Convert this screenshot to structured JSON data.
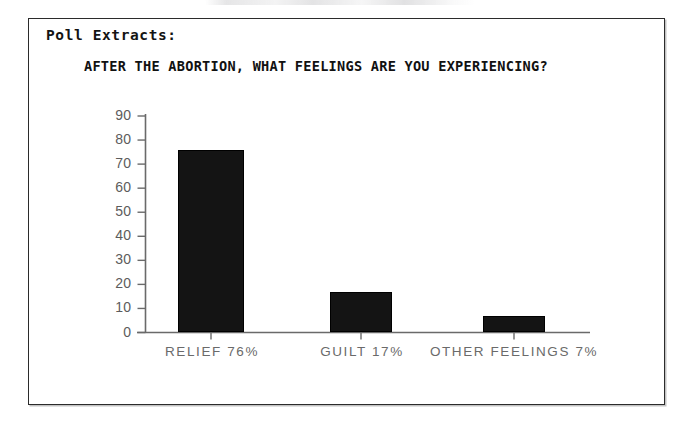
{
  "document": {
    "section_heading": "Poll Extracts:",
    "frame": {
      "border_color": "#2b2b2b"
    }
  },
  "chart_data": {
    "type": "bar",
    "title": "AFTER THE ABORTION, WHAT FEELINGS ARE YOU EXPERIENCING?",
    "xlabel": "",
    "ylabel": "",
    "categories": [
      "RELIEF  76%",
      "GUILT  17%",
      "OTHER FEELINGS  7%"
    ],
    "category_names": [
      "RELIEF",
      "GUILT",
      "OTHER FEELINGS"
    ],
    "percent_labels": [
      "76%",
      "17%",
      "7%"
    ],
    "values": [
      76,
      17,
      7
    ],
    "ylim": [
      0,
      90
    ],
    "yticks": [
      0,
      10,
      20,
      30,
      40,
      50,
      60,
      70,
      80,
      90
    ],
    "ytick_labels": [
      "0",
      "10",
      "20",
      "30",
      "40",
      "50",
      "60",
      "70",
      "80",
      "90"
    ],
    "grid": false,
    "legend": null,
    "bar_color": "#141414",
    "axis_color": "#6a6a6a"
  }
}
